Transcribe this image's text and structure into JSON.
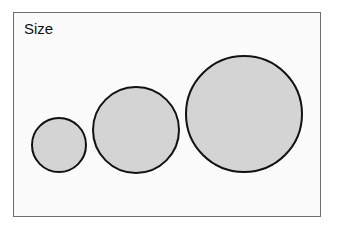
{
  "diagram": {
    "label": "Size",
    "circles": [
      {
        "name": "small",
        "cx": 59,
        "cy": 145,
        "r": 27
      },
      {
        "name": "medium",
        "cx": 136,
        "cy": 130,
        "r": 43
      },
      {
        "name": "large",
        "cx": 244,
        "cy": 114,
        "r": 58
      }
    ],
    "colors": {
      "fill": "#d4d4d4",
      "stroke": "#111111",
      "frame": "#6e6e6e",
      "background": "#fbfbfb"
    }
  }
}
